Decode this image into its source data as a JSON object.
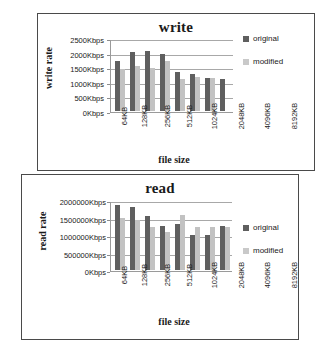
{
  "figure": {
    "background": "#ffffff",
    "panel_border_color": "#4a4a4a"
  },
  "charts": [
    {
      "id": "write",
      "title": "write",
      "ylabel": "write rate",
      "xlabel": "file size",
      "legend": [
        {
          "label": "original",
          "color": "#5f5f5f"
        },
        {
          "label": "modified",
          "color": "#c9c9c9"
        }
      ],
      "yticks": [
        "0Kbps",
        "500Kbps",
        "1000Kbps",
        "1500Kbps",
        "2000Kbps",
        "2500Kbps"
      ],
      "categories": [
        "64KB",
        "128KB",
        "256KB",
        "512KB",
        "1024KB",
        "2048KB",
        "4096KB",
        "8192KB"
      ]
    },
    {
      "id": "read",
      "title": "read",
      "ylabel": "read rate",
      "xlabel": "file size",
      "legend": [
        {
          "label": "original",
          "color": "#5f5f5f"
        },
        {
          "label": "modified",
          "color": "#c9c9c9"
        }
      ],
      "yticks": [
        "0Kbps",
        "500000Kbps",
        "1000000Kbps",
        "1500000Kbps",
        "2000000Kbps"
      ],
      "categories": [
        "64KB",
        "128KB",
        "256KB",
        "512KB",
        "1024KB",
        "2048KB",
        "4096KB",
        "8192KB"
      ]
    }
  ],
  "chart_data": [
    {
      "type": "bar",
      "title": "write",
      "xlabel": "file size",
      "ylabel": "write rate",
      "ylim": [
        0,
        2500
      ],
      "yunit": "Kbps",
      "ytick_values": [
        0,
        500,
        1000,
        1500,
        2000,
        2500
      ],
      "ytick_labels": [
        "0Kbps",
        "500Kbps",
        "1000Kbps",
        "1500Kbps",
        "2000Kbps",
        "2500Kbps"
      ],
      "grid": true,
      "legend_position": "right",
      "categories": [
        "64KB",
        "128KB",
        "256KB",
        "512KB",
        "1024KB",
        "2048KB",
        "4096KB",
        "8192KB"
      ],
      "series": [
        {
          "name": "original",
          "color": "#5f5f5f",
          "values": [
            1700,
            2030,
            2060,
            1950,
            1330,
            1270,
            1130,
            1080
          ]
        },
        {
          "name": "modified",
          "color": "#c2c2c2",
          "values": [
            1450,
            1550,
            1480,
            1700,
            1100,
            1170,
            1120,
            0
          ]
        }
      ]
    },
    {
      "type": "bar",
      "title": "read",
      "xlabel": "file size",
      "ylabel": "read rate",
      "ylim": [
        0,
        2000000
      ],
      "yunit": "Kbps",
      "ytick_values": [
        0,
        500000,
        1000000,
        1500000,
        2000000
      ],
      "ytick_labels": [
        "0Kbps",
        "500000Kbps",
        "1000000Kbps",
        "1500000Kbps",
        "2000000Kbps"
      ],
      "grid": true,
      "legend_position": "right",
      "categories": [
        "64KB",
        "128KB",
        "256KB",
        "512KB",
        "1024KB",
        "2048KB",
        "4096KB",
        "8192KB"
      ],
      "series": [
        {
          "name": "original",
          "color": "#5f5f5f",
          "values": [
            1850000,
            1800000,
            1550000,
            1270000,
            1310000,
            1000000,
            1000000,
            1270000
          ]
        },
        {
          "name": "modified",
          "color": "#c2c2c2",
          "values": [
            1500000,
            1430000,
            1230000,
            1100000,
            1580000,
            1220000,
            1230000,
            1220000
          ]
        }
      ]
    }
  ]
}
